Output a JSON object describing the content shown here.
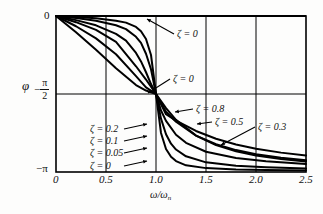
{
  "chart_data": {
    "type": "line",
    "title": "",
    "xlabel": "ω/ωₙ",
    "ylabel": "φ",
    "xlim": [
      0,
      2.5
    ],
    "ylim": [
      -3.14159265,
      0
    ],
    "grid": true,
    "legend_position": "inline-annotations",
    "x_ticks": [
      "0",
      "0.5",
      "1.0",
      "1.5",
      "2.0",
      "2.5"
    ],
    "x_tick_values": [
      0,
      0.5,
      1.0,
      1.5,
      2.0,
      2.5
    ],
    "y_ticks": [
      "0",
      "−π/2",
      "−π"
    ],
    "y_tick_values": [
      0,
      -1.5707963,
      -3.1415927
    ],
    "series": [
      {
        "name": "ζ = 0",
        "zeta": 0,
        "x": [
          0,
          0.2,
          0.4,
          0.6,
          0.8,
          0.9,
          0.97,
          1.0,
          1.0,
          1.03,
          1.1,
          1.2,
          1.4,
          1.7,
          2.0,
          2.5
        ],
        "y": [
          0,
          0,
          0,
          0,
          0,
          0,
          0,
          0,
          -3.1416,
          -3.1416,
          -3.1416,
          -3.1416,
          -3.1416,
          -3.1416,
          -3.1416,
          -3.1416
        ],
        "style": "dashed-step"
      },
      {
        "name": "ζ = 0.05",
        "zeta": 0.05,
        "x": [
          0,
          0.2,
          0.4,
          0.6,
          0.7,
          0.8,
          0.85,
          0.9,
          0.95,
          1.0,
          1.05,
          1.1,
          1.15,
          1.2,
          1.3,
          1.5,
          1.8,
          2.1,
          2.5
        ],
        "y": [
          0,
          -0.0208,
          -0.0476,
          -0.0938,
          -0.1335,
          -0.2198,
          -0.3059,
          -0.4636,
          -0.7854,
          -1.5708,
          -2.3562,
          -2.6779,
          -2.8355,
          -2.9216,
          -3.0079,
          -3.0635,
          -3.0904,
          -3.1019,
          -3.1105
        ]
      },
      {
        "name": "ζ = 0.1",
        "zeta": 0.1,
        "x": [
          0,
          0.2,
          0.4,
          0.6,
          0.7,
          0.8,
          0.85,
          0.9,
          0.95,
          1.0,
          1.05,
          1.1,
          1.15,
          1.2,
          1.3,
          1.5,
          1.8,
          2.1,
          2.5
        ],
        "y": [
          0,
          -0.0417,
          -0.0952,
          -0.1862,
          -0.2639,
          -0.4182,
          -0.5404,
          -0.761,
          -1.0714,
          -1.5708,
          -2.0661,
          -2.3828,
          -2.5713,
          -2.689,
          -2.8261,
          -2.9473,
          -3.0165,
          -3.0478,
          -3.0718
        ]
      },
      {
        "name": "ζ = 0.2",
        "zeta": 0.2,
        "x": [
          0,
          0.2,
          0.4,
          0.6,
          0.7,
          0.8,
          0.85,
          0.9,
          0.95,
          1.0,
          1.05,
          1.1,
          1.2,
          1.3,
          1.5,
          1.8,
          2.1,
          2.5
        ],
        "y": [
          0,
          -0.0832,
          -0.1877,
          -0.3588,
          -0.496,
          -0.7445,
          -0.9152,
          -1.1326,
          -1.3709,
          -1.5708,
          -1.902,
          -2.1112,
          -2.3906,
          -2.5536,
          -2.7331,
          -2.8616,
          -2.925,
          -2.978
        ]
      },
      {
        "name": "ζ = 0.3",
        "zeta": 0.3,
        "x": [
          0,
          0.2,
          0.4,
          0.6,
          0.8,
          0.9,
          1.0,
          1.1,
          1.2,
          1.4,
          1.6,
          1.8,
          2.0,
          2.25,
          2.5
        ],
        "y": [
          0,
          -0.1244,
          -0.2783,
          -0.5218,
          -1.0122,
          -1.2793,
          -1.5708,
          -1.8566,
          -2.0899,
          -2.4083,
          -2.5994,
          -2.7226,
          -2.8073,
          -2.8792,
          -2.9298
        ]
      },
      {
        "name": "ζ = 0.5",
        "zeta": 0.5,
        "x": [
          0,
          0.2,
          0.4,
          0.6,
          0.8,
          0.9,
          1.0,
          1.1,
          1.2,
          1.4,
          1.6,
          1.8,
          2.0,
          2.25,
          2.5
        ],
        "y": [
          0,
          -0.2063,
          -0.451,
          -0.7712,
          -1.211,
          -1.4382,
          -1.5708,
          -1.9269,
          -2.1304,
          -2.4088,
          -2.5836,
          -2.7006,
          -2.7828,
          -2.8541,
          -2.9048
        ]
      },
      {
        "name": "ζ = 0.8",
        "zeta": 0.8,
        "x": [
          0,
          0.2,
          0.4,
          0.6,
          0.8,
          0.9,
          1.0,
          1.1,
          1.2,
          1.4,
          1.6,
          1.8,
          2.0,
          2.25,
          2.5
        ],
        "y": [
          0,
          -0.3277,
          -0.682,
          -1.0517,
          -1.3905,
          -1.501,
          -1.5708,
          -1.9788,
          -2.1088,
          -2.3155,
          -2.4712,
          -2.5868,
          -2.6726,
          -2.7513,
          -2.8081
        ]
      }
    ],
    "annotations": [
      {
        "id": "zeta-0-top",
        "text": "ζ = 0",
        "x_px": 177,
        "y_px": 29,
        "leader_to_x_px": 147,
        "leader_to_y_px": 19
      },
      {
        "id": "zeta-0-mid",
        "text": "ζ = 0",
        "x_px": 173,
        "y_px": 74,
        "leader_to_x_px": 148,
        "leader_to_y_px": 93
      },
      {
        "id": "zeta-0p8",
        "text": "ζ = 0.8",
        "x_px": 196,
        "y_px": 104,
        "leader_to_x_px": 175,
        "leader_to_y_px": 112
      },
      {
        "id": "zeta-0p5",
        "text": "ζ = 0.5",
        "x_px": 215,
        "y_px": 117,
        "leader_to_x_px": 197,
        "leader_to_y_px": 124
      },
      {
        "id": "zeta-0p3",
        "text": "ζ = 0.3",
        "x_px": 258,
        "y_px": 122,
        "leader_to_x_px": 221,
        "leader_to_y_px": 145
      },
      {
        "id": "zeta-0p2",
        "text": "ζ = 0.2",
        "x_px": 90,
        "y_px": 124,
        "leader_to_x_px": 147,
        "leader_to_y_px": 124
      },
      {
        "id": "zeta-0p1",
        "text": "ζ = 0.1",
        "x_px": 90,
        "y_px": 136,
        "leader_to_x_px": 147,
        "leader_to_y_px": 136
      },
      {
        "id": "zeta-0p05",
        "text": "ζ = 0.05",
        "x_px": 90,
        "y_px": 148,
        "leader_to_x_px": 147,
        "leader_to_y_px": 148
      },
      {
        "id": "zeta-0-bottom",
        "text": "ζ = 0",
        "x_px": 90,
        "y_px": 161,
        "leader_to_x_px": 147,
        "leader_to_y_px": 161
      }
    ]
  },
  "axes": {
    "y_label": "φ",
    "y_tick_top": "0",
    "y_tick_mid_sign": "−",
    "y_tick_mid_num": "π",
    "y_tick_mid_den": "2",
    "y_tick_bottom": "−π",
    "x_label_num": "ω",
    "x_label_den": "ω",
    "x_label_sub": "n",
    "x_tick_labels": [
      "0",
      "0.5",
      "1.0",
      "1.5",
      "2.0",
      "2.5"
    ]
  },
  "colors": {
    "curve": "#000000",
    "grid": "#000000",
    "frame": "#000000",
    "background": "#fdfdfc",
    "text": "#111111"
  }
}
